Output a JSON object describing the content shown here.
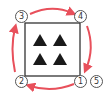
{
  "diagram": {
    "triangle_count": 4,
    "labels": [
      {
        "id": "label-1",
        "text": "1",
        "position": "bottom-right"
      },
      {
        "id": "label-2",
        "text": "2",
        "position": "bottom-left"
      },
      {
        "id": "label-3",
        "text": "3",
        "position": "top-left"
      },
      {
        "id": "label-4",
        "text": "4",
        "position": "top-right"
      },
      {
        "id": "label-5",
        "text": "5",
        "position": "bottom-right-outer"
      }
    ],
    "labels_glyphs": {
      "l1": "①",
      "l2": "②",
      "l3": "③",
      "l4": "④",
      "l5": "⑤"
    },
    "sequence": [
      "1",
      "2",
      "3",
      "4",
      "5"
    ],
    "colors": {
      "arrow": "#e8505b",
      "box": "#333333",
      "triangle": "#1a1a1a"
    }
  }
}
